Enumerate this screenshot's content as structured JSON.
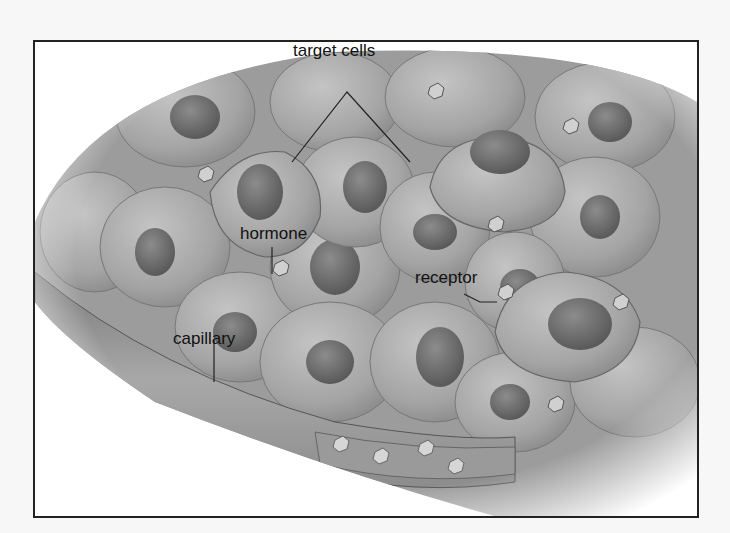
{
  "figure": {
    "labels": {
      "target_cells": "target cells",
      "hormone": "hormone",
      "receptor": "receptor",
      "capillary": "capillary"
    },
    "colors": {
      "frame": "#222222",
      "cell_fill": "#a9a9a9",
      "cell_edge": "#6e6e6e",
      "nucleus": "#6a6a6a",
      "capillary": "#8a8a8a",
      "background": "#ffffff",
      "label_text": "#111111"
    }
  }
}
